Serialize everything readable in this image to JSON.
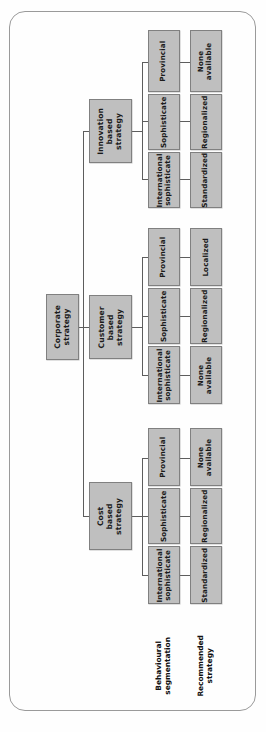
{
  "diagram": {
    "orientation": "rotated-90",
    "colors": {
      "box_fill": "#bfbfbf",
      "box_border": "#808080",
      "line": "#5d5d5d",
      "frame_border": "#9a9a9a",
      "page_background": "#fefefe",
      "text": "#1b1b1b"
    },
    "root": {
      "label": "Corporate\nstrategy"
    },
    "row_labels": [
      {
        "id": "behavioural",
        "label": "Behavioural\nsegmentation"
      },
      {
        "id": "recommended",
        "label": "Recommended\nstrategy"
      }
    ],
    "branches": [
      {
        "id": "innovation",
        "label": "Innovation\nbased\nstrategy",
        "segments": [
          {
            "behavioural": "Provincial",
            "recommended": "None\navailable"
          },
          {
            "behavioural": "Sophisticate",
            "recommended": "Regionalized"
          },
          {
            "behavioural": "International\nsophisticate",
            "recommended": "Standardized"
          }
        ]
      },
      {
        "id": "customer",
        "label": "Customer\nbased\nstrategy",
        "segments": [
          {
            "behavioural": "Provincial",
            "recommended": "Localized"
          },
          {
            "behavioural": "Sophisticate",
            "recommended": "Regionalized"
          },
          {
            "behavioural": "International\nsophisticate",
            "recommended": "None\navailable"
          }
        ]
      },
      {
        "id": "cost",
        "label": "Cost based\nstrategy",
        "segments": [
          {
            "behavioural": "Provincial",
            "recommended": "None\navailable"
          },
          {
            "behavioural": "Sophisticate",
            "recommended": "Regionalized"
          },
          {
            "behavioural": "International\nsophisticate",
            "recommended": "Standardized"
          }
        ]
      }
    ]
  }
}
